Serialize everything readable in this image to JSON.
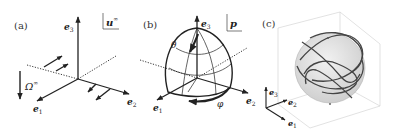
{
  "panels": {
    "a": {
      "label": "(a)",
      "axes": {
        "e1": "e",
        "e1_sub": "1",
        "e2": "e",
        "e2_sub": "2",
        "e3": "e",
        "e3_sub": "3"
      },
      "flow_label": "u",
      "flow_sup": "∞",
      "rotation_label": "Ω",
      "rotation_sup": "∞"
    },
    "b": {
      "label": "(b)",
      "axes": {
        "e1": "e",
        "e1_sub": "1",
        "e2": "e",
        "e2_sub": "2",
        "e3": "e",
        "e3_sub": "3"
      },
      "vector_label": "p",
      "polar_angle": "θ",
      "azimuth_angle": "φ"
    },
    "c": {
      "label": "(c)",
      "axes": {
        "e1": "e",
        "e1_sub": "1",
        "e2": "e",
        "e2_sub": "2",
        "e3": "e",
        "e3_sub": "3"
      }
    }
  },
  "colors": {
    "ink": "#222222",
    "sphere_fill": "#d9d9d9",
    "box": "#cccccc"
  }
}
